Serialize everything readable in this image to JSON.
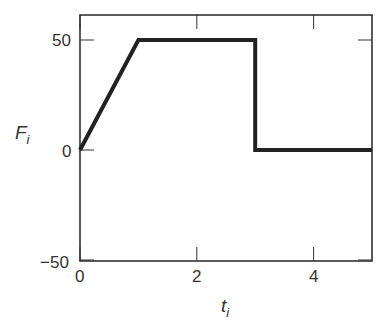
{
  "chart_data": {
    "type": "line",
    "title": "",
    "xlabel": "t",
    "xlabel_sub": "i",
    "ylabel": "F",
    "ylabel_sub": "i",
    "xlim": [
      0,
      5
    ],
    "ylim": [
      -50,
      60
    ],
    "xticks": [
      0,
      2,
      4
    ],
    "yticks": [
      -50,
      0,
      50
    ],
    "xtick_labels": [
      "0",
      "2",
      "4"
    ],
    "ytick_labels": [
      "−50",
      "0",
      "50"
    ],
    "grid": false,
    "legend": null,
    "series": [
      {
        "name": "F_i",
        "x": [
          0,
          1,
          3,
          3,
          5
        ],
        "y": [
          0,
          50,
          50,
          0,
          0
        ],
        "color": "#222222"
      }
    ]
  }
}
